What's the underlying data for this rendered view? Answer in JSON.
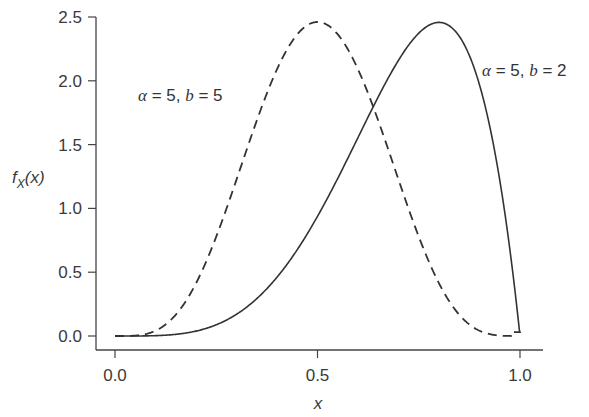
{
  "chart_data": {
    "type": "line",
    "title": "",
    "xlabel": "x",
    "ylabel": "f_X(x)",
    "xlim": [
      -0.04,
      1.04
    ],
    "ylim": [
      -0.1,
      2.55
    ],
    "x_ticks": [
      "0.0",
      "0.5",
      "1.0"
    ],
    "y_ticks": [
      "0.0",
      "0.5",
      "1.0",
      "1.5",
      "2.0",
      "2.5"
    ],
    "grid": false,
    "legend": "none (inline annotations)",
    "series": [
      {
        "name": "α = 5, b = 5",
        "style": "dashed",
        "x": [
          0.0,
          0.05,
          0.1,
          0.15,
          0.2,
          0.25,
          0.3,
          0.35,
          0.4,
          0.45,
          0.5,
          0.55,
          0.6,
          0.65,
          0.7,
          0.75,
          0.8,
          0.85,
          0.9,
          0.95,
          0.98,
          1.0
        ],
        "values": [
          0.0,
          0.0008,
          0.0207,
          0.1211,
          0.3303,
          0.6082,
          0.953,
          1.282,
          1.672,
          2.079,
          2.4609,
          2.079,
          1.672,
          1.282,
          0.953,
          0.6082,
          0.3303,
          0.1211,
          0.0207,
          0.0008,
          0.0,
          0.0
        ]
      },
      {
        "name": "α = 5, b = 2",
        "style": "solid",
        "x": [
          0.0,
          0.1,
          0.2,
          0.3,
          0.4,
          0.5,
          0.6,
          0.65,
          0.7,
          0.75,
          0.8,
          0.85,
          0.9,
          0.95,
          0.98,
          1.0
        ],
        "values": [
          0.0,
          0.0005,
          0.0077,
          0.034,
          0.0922,
          0.9375,
          1.5552,
          1.9279,
          2.1609,
          2.373,
          2.4576,
          2.396,
          1.9683,
          1.114,
          0.4613,
          0.0
        ]
      }
    ],
    "annotations": [
      {
        "text": "α = 5, b = 5",
        "series": "dashed",
        "position": "left of dashed peak"
      },
      {
        "text": "α = 5, b = 2",
        "series": "solid",
        "position": "right of solid peak"
      }
    ]
  },
  "labels": {
    "ylabel_f": "f",
    "ylabel_sub": "X",
    "ylabel_paren": "(x)",
    "xlabel": "x",
    "ann_left_alpha": "α",
    "ann_left_rest": " = 5, ",
    "ann_left_b": "b",
    "ann_left_end": " = 5",
    "ann_right_alpha": "α",
    "ann_right_rest": " = 5, ",
    "ann_right_b": "b",
    "ann_right_end": " = 2"
  }
}
